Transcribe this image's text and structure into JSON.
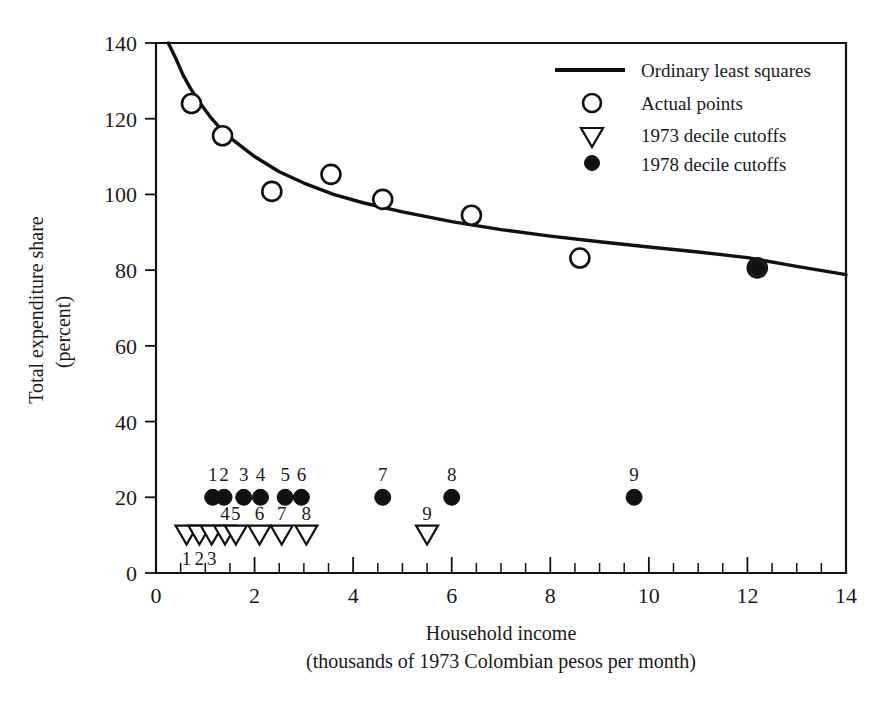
{
  "chart_data": {
    "type": "scatter",
    "title": "",
    "xlabel": "Household income",
    "xlabel_sub": "(thousands of 1973 Colombian pesos per month)",
    "ylabel": "Total expenditure share",
    "ylabel_sub": "(percent)",
    "xlim": [
      0,
      14
    ],
    "ylim": [
      0,
      140
    ],
    "grid": false,
    "x_ticks": [
      0,
      2,
      4,
      6,
      8,
      10,
      12,
      14
    ],
    "x_tick_labels": [
      "0",
      "2",
      "4",
      "6",
      "8",
      "10",
      "12",
      "14"
    ],
    "x_minor_step": 0.5,
    "y_ticks": [
      0,
      20,
      40,
      60,
      80,
      100,
      120,
      140
    ],
    "y_tick_labels": [
      "0",
      "20",
      "40",
      "60",
      "80",
      "100",
      "120",
      "140"
    ],
    "legend_position": "top-right",
    "series": [
      {
        "name": "Ordinary least squares",
        "type": "line",
        "marker": "line",
        "x": [
          0.25,
          0.4,
          0.55,
          0.7,
          0.9,
          1.1,
          1.3,
          1.6,
          2.0,
          2.5,
          3.0,
          3.6,
          4.2,
          5.0,
          6.0,
          7.0,
          8.0,
          9.0,
          10.0,
          11.0,
          12.0,
          13.0,
          14.0
        ],
        "y": [
          140.0,
          136.0,
          131.5,
          128.0,
          124.0,
          120.5,
          117.5,
          114.0,
          110.0,
          106.0,
          103.0,
          100.0,
          97.8,
          95.4,
          92.8,
          90.7,
          89.0,
          87.5,
          86.1,
          84.8,
          83.3,
          81.0,
          78.8
        ]
      },
      {
        "name": "Actual points",
        "type": "scatter",
        "marker": "open-circle",
        "x": [
          0.72,
          1.35,
          2.35,
          3.55,
          4.6,
          6.4,
          8.6,
          12.2
        ],
        "y": [
          124.0,
          115.5,
          100.8,
          105.3,
          98.7,
          94.5,
          83.2,
          80.6
        ]
      },
      {
        "name": "1973 decile cutoffs",
        "type": "scatter",
        "marker": "open-triangle-down",
        "y_constant": 10,
        "labels": [
          "1",
          "2",
          "3",
          "4",
          "5",
          "6",
          "7",
          "8",
          "9"
        ],
        "x": [
          0.62,
          0.88,
          1.13,
          1.4,
          1.62,
          2.1,
          2.55,
          3.05,
          5.5
        ],
        "y": [
          10,
          10,
          10,
          10,
          10,
          10,
          10,
          10,
          10
        ],
        "label_positions": [
          "below",
          "below",
          "below",
          "above",
          "above",
          "above",
          "above",
          "above",
          "above"
        ]
      },
      {
        "name": "1978 decile cutoffs",
        "type": "scatter",
        "marker": "filled-circle",
        "y_constant": 20,
        "labels": [
          "1",
          "2",
          "3",
          "4",
          "5",
          "6",
          "7",
          "8",
          "9",
          "10"
        ],
        "x": [
          1.15,
          1.38,
          1.78,
          2.12,
          2.62,
          2.95,
          4.6,
          6.0,
          9.7,
          12.2
        ],
        "y": [
          20,
          20,
          20,
          20,
          20,
          20,
          20,
          20,
          20,
          80.6
        ],
        "label_positions": [
          "above",
          "above",
          "above",
          "above",
          "above",
          "above",
          "above",
          "above",
          "above",
          "none"
        ]
      }
    ],
    "legend": [
      {
        "label": "Ordinary least squares",
        "marker": "line"
      },
      {
        "label": "Actual points",
        "marker": "open-circle"
      },
      {
        "label": "1973 decile cutoffs",
        "marker": "open-triangle-down"
      },
      {
        "label": "1978 decile cutoffs",
        "marker": "filled-circle"
      }
    ],
    "colors": {
      "ink": "#111111",
      "background": "#ffffff"
    }
  }
}
